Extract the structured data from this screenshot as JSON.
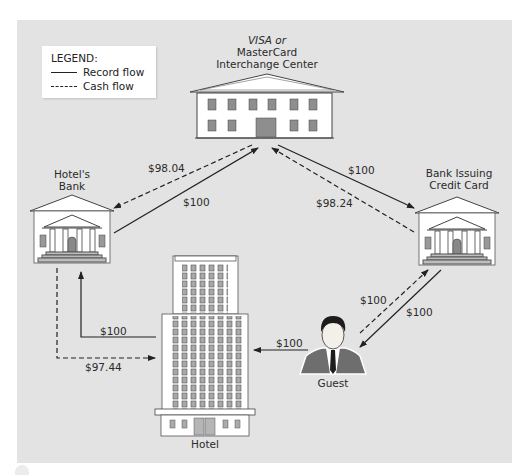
{
  "legend": {
    "title": "LEGEND:",
    "items": [
      {
        "style": "solid",
        "label": "Record flow"
      },
      {
        "style": "dashed",
        "label": "Cash flow"
      }
    ]
  },
  "nodes": {
    "interchange": {
      "label_line1": "VISA or",
      "label_line2": "MasterCard",
      "label_line3": "Interchange Center",
      "icon": "office-building-icon"
    },
    "hotels_bank": {
      "label_line1": "Hotel's",
      "label_line2": "Bank",
      "icon": "bank-building-icon"
    },
    "issuing_bank": {
      "label_line1": "Bank Issuing",
      "label_line2": "Credit Card",
      "icon": "bank-building-icon"
    },
    "hotel": {
      "label": "Hotel",
      "icon": "hotel-tower-icon"
    },
    "guest": {
      "label": "Guest",
      "icon": "person-portrait-icon"
    }
  },
  "flows": [
    {
      "id": "interchange-to-hotels-bank",
      "type": "cash",
      "amount": "$98.04"
    },
    {
      "id": "hotels-bank-to-interchange",
      "type": "record",
      "amount": "$100"
    },
    {
      "id": "interchange-to-issuing-bank",
      "type": "record",
      "amount": "$100"
    },
    {
      "id": "issuing-bank-to-interchange",
      "type": "cash",
      "amount": "$98.24"
    },
    {
      "id": "guest-to-issuing-bank",
      "type": "cash",
      "amount": "$100"
    },
    {
      "id": "issuing-bank-to-guest",
      "type": "record",
      "amount": "$100"
    },
    {
      "id": "guest-to-hotel",
      "type": "record",
      "amount": "$100"
    },
    {
      "id": "hotel-to-hotels-bank",
      "type": "record",
      "amount": "$100"
    },
    {
      "id": "hotels-bank-to-hotel",
      "type": "cash",
      "amount": "$97.44"
    }
  ],
  "colors": {
    "panel": "#e3e3e3",
    "line": "#222222",
    "building_fill": "#ffffff",
    "window": "#9a9a9a"
  }
}
